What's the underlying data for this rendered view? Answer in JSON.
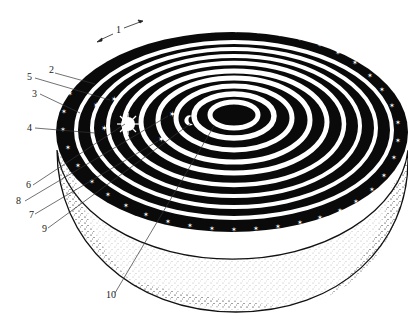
{
  "diagram": {
    "type": "cosmological-spheres-cutaway",
    "colors": {
      "ink": "#0a0a0a",
      "paper": "#ffffff",
      "stipple": "#333333"
    },
    "labels": [
      {
        "id": "1",
        "text": "1"
      },
      {
        "id": "2",
        "text": "2"
      },
      {
        "id": "3",
        "text": "3"
      },
      {
        "id": "4",
        "text": "4"
      },
      {
        "id": "5",
        "text": "5"
      },
      {
        "id": "6",
        "text": "6"
      },
      {
        "id": "7",
        "text": "7"
      },
      {
        "id": "8",
        "text": "8"
      },
      {
        "id": "9",
        "text": "9"
      },
      {
        "id": "10",
        "text": "10"
      }
    ],
    "rotation_arrows": {
      "left": "←",
      "right": "→"
    }
  }
}
